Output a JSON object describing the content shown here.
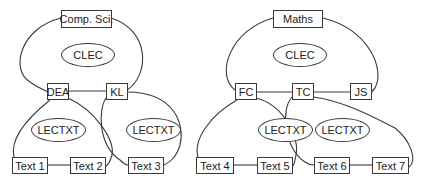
{
  "left": {
    "root": "Comp. Sci.",
    "clec": "CLEC",
    "nodes": [
      "DEA",
      "KL"
    ],
    "lectxt": [
      "LECTXT",
      "LECTXT"
    ],
    "texts": [
      "Text 1",
      "Text 2",
      "Text 3"
    ]
  },
  "right": {
    "root": "Maths",
    "clec": "CLEC",
    "nodes": [
      "FC",
      "TC",
      "JS"
    ],
    "lectxt": [
      "LECTXT",
      "LECTXT"
    ],
    "texts": [
      "Text 4",
      "Text 5",
      "Text 6",
      "Text 7"
    ]
  }
}
